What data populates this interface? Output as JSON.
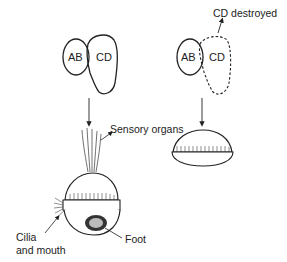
{
  "diagram": {
    "type": "embryology-cell-deletion",
    "left_panel": {
      "cells": [
        {
          "label": "AB"
        },
        {
          "label": "CD"
        }
      ],
      "result_labels": {
        "sensory": "Sensory organs",
        "cilia_line1": "Cilia",
        "cilia_line2": "and mouth",
        "foot": "Foot"
      }
    },
    "right_panel": {
      "cells": [
        {
          "label": "AB"
        },
        {
          "label": "CD"
        }
      ],
      "annotation": "CD destroyed"
    },
    "colors": {
      "stroke": "#222222",
      "background": "#ffffff"
    }
  }
}
